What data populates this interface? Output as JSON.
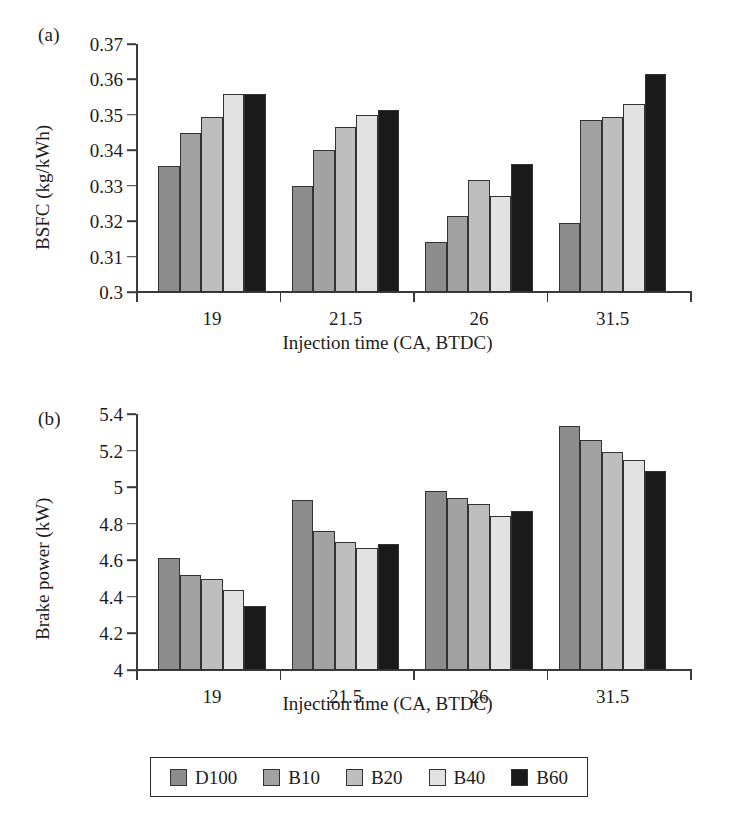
{
  "figure": {
    "panels": [
      {
        "label": "(a)",
        "id": "panel-a"
      },
      {
        "label": "(b)",
        "id": "panel-b"
      }
    ]
  },
  "legend": {
    "position": "bottom",
    "items": [
      {
        "label": "D100",
        "color": "#8d8d8d"
      },
      {
        "label": "B10",
        "color": "#a2a2a2"
      },
      {
        "label": "B20",
        "color": "#bebebe"
      },
      {
        "label": "B40",
        "color": "#e2e2e2"
      },
      {
        "label": "B60",
        "color": "#1a1a1a"
      }
    ]
  },
  "chart_data": [
    {
      "type": "bar",
      "panel": "(a)",
      "title": "",
      "xlabel": "Injection time (CA, BTDC)",
      "ylabel": "BSFC (kg/kWh)",
      "categories": [
        "19",
        "21.5",
        "26",
        "31.5"
      ],
      "ylim": [
        0.3,
        0.37
      ],
      "yticks": [
        0.3,
        0.31,
        0.32,
        0.33,
        0.34,
        0.35,
        0.36,
        0.37
      ],
      "ytick_labels": [
        "0.3",
        "0.31",
        "0.32",
        "0.33",
        "0.34",
        "0.35",
        "0.36",
        "0.37"
      ],
      "grid": false,
      "legend_position": "bottom",
      "series": [
        {
          "name": "D100",
          "color": "#8d8d8d",
          "values": [
            0.3355,
            0.33,
            0.314,
            0.3195
          ]
        },
        {
          "name": "B10",
          "color": "#a2a2a2",
          "values": [
            0.345,
            0.34,
            0.3215,
            0.3485
          ]
        },
        {
          "name": "B20",
          "color": "#bebebe",
          "values": [
            0.3495,
            0.3465,
            0.3315,
            0.3495
          ]
        },
        {
          "name": "B40",
          "color": "#e2e2e2",
          "values": [
            0.356,
            0.35,
            0.327,
            0.353
          ]
        },
        {
          "name": "B60",
          "color": "#1a1a1a",
          "values": [
            0.356,
            0.3515,
            0.336,
            0.3615
          ]
        }
      ]
    },
    {
      "type": "bar",
      "panel": "(b)",
      "title": "",
      "xlabel": "Injection time (CA, BTDC)",
      "ylabel": "Brake power (kW)",
      "categories": [
        "19",
        "21.5",
        "26",
        "31.5"
      ],
      "ylim": [
        4,
        5.4
      ],
      "yticks": [
        4,
        4.2,
        4.4,
        4.6,
        4.8,
        5,
        5.2,
        5.4
      ],
      "ytick_labels": [
        "4",
        "4.2",
        "4.4",
        "4.6",
        "4.8",
        "5",
        "5.2",
        "5.4"
      ],
      "grid": false,
      "legend_position": "bottom",
      "series": [
        {
          "name": "D100",
          "color": "#8d8d8d",
          "values": [
            4.61,
            4.93,
            4.98,
            5.335
          ]
        },
        {
          "name": "B10",
          "color": "#a2a2a2",
          "values": [
            4.52,
            4.76,
            4.94,
            5.26
          ]
        },
        {
          "name": "B20",
          "color": "#bebebe",
          "values": [
            4.5,
            4.7,
            4.91,
            5.19
          ]
        },
        {
          "name": "B40",
          "color": "#e2e2e2",
          "values": [
            4.44,
            4.67,
            4.84,
            5.15
          ]
        },
        {
          "name": "B60",
          "color": "#1a1a1a",
          "values": [
            4.35,
            4.69,
            4.87,
            5.09
          ]
        }
      ]
    }
  ]
}
